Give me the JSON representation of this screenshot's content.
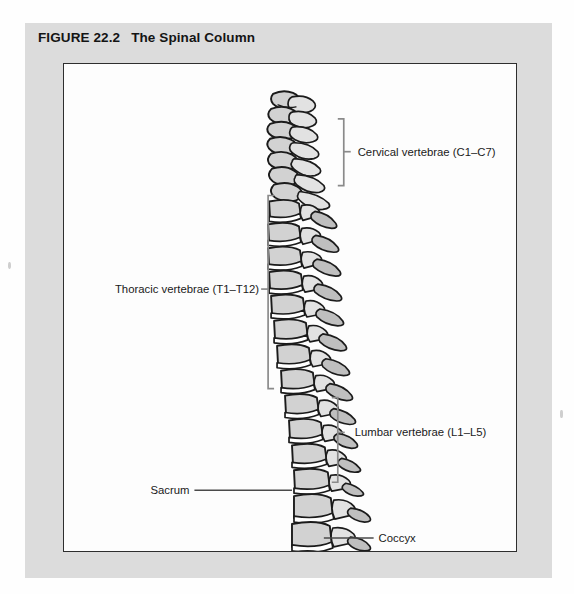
{
  "figure": {
    "number_label": "FIGURE 22.2",
    "title": "The Spinal Column"
  },
  "illustration": {
    "alt_name": "lateral view of the human vertebral column",
    "regions": [
      {
        "id": "cervical",
        "label": "Cervical vertebrae (C1–C7)",
        "vertebra_count": 7,
        "bracket": {
          "x": 281,
          "y_top": 55,
          "y_bottom": 122,
          "tick_y": 88,
          "side": "right"
        },
        "label_x": 295,
        "label_y": 92
      },
      {
        "id": "thoracic",
        "label": "Thoracic vertebrae (T1–T12)",
        "vertebra_count": 12,
        "bracket": {
          "x": 205,
          "y_top": 132,
          "y_bottom": 326,
          "tick_y": 226,
          "side": "left"
        },
        "label_x": 196,
        "label_y": 230
      },
      {
        "id": "lumbar",
        "label": "Lumbar vertebrae (L1–L5)",
        "vertebra_count": 5,
        "bracket": {
          "x": 275,
          "y_top": 335,
          "y_bottom": 420,
          "tick_y": 370,
          "side": "right"
        },
        "label_x": 292,
        "label_y": 374
      },
      {
        "id": "sacrum",
        "label": "Sacrum",
        "leader": {
          "x1": 131,
          "x2": 229,
          "y": 428
        },
        "label_x": 126,
        "label_y": 432
      },
      {
        "id": "coccyx",
        "label": "Coccyx",
        "leader": {
          "x1": 261,
          "x2": 311,
          "y": 476
        },
        "label_x": 316,
        "label_y": 480
      }
    ],
    "colors": {
      "panel_background": "#dcdcdc",
      "art_background": "#fdfdfd",
      "art_border": "#2e2e2e",
      "bone_fill": "#d2d2d2",
      "bone_outline": "#1b1b1b",
      "bracket": "#8a8a8a",
      "leader_line": "#4a4a4a",
      "label_text": "#1a1a1a",
      "title_text": "#141414"
    }
  }
}
